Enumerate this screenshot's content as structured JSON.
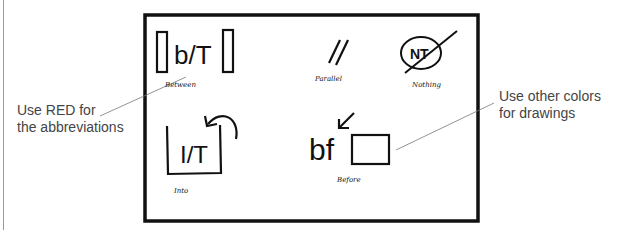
{
  "callouts": {
    "left": {
      "line1": "Use RED for",
      "line2": "the abbreviations"
    },
    "right": {
      "line1": "Use other colors",
      "line2": "for drawings"
    }
  },
  "symbols": [
    {
      "glyph": "b/T",
      "label": "Between"
    },
    {
      "glyph": "//",
      "label": "Parallel"
    },
    {
      "glyph": "NT",
      "label": "Nothing"
    },
    {
      "glyph": "I/T",
      "label": "Into"
    },
    {
      "glyph": "bf",
      "label": "Before"
    }
  ],
  "colors": {
    "ink": "#111111",
    "leader": "#777777",
    "callout_text": "#444444"
  }
}
